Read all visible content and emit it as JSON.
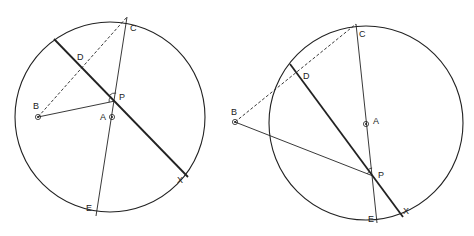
{
  "colors": {
    "stroke": "#222222",
    "background": "#ffffff"
  },
  "figures": [
    {
      "id": "left",
      "circle": {
        "cx": 110,
        "cy": 117,
        "r": 95
      },
      "points": {
        "C": {
          "x": 127,
          "y": 17,
          "label": "C",
          "lx": 130,
          "ly": 31
        },
        "D": {
          "x": 82,
          "y": 67,
          "label": "D",
          "lx": 77,
          "ly": 60
        },
        "B": {
          "x": 38,
          "y": 117,
          "label": "B",
          "lx": 33,
          "ly": 109
        },
        "P": {
          "x": 115,
          "y": 101,
          "label": "P",
          "lx": 119,
          "ly": 100
        },
        "A": {
          "x": 112,
          "y": 117,
          "label": "A",
          "lx": 100,
          "ly": 120
        },
        "E": {
          "x": 96,
          "y": 216,
          "label": "E",
          "lx": 86,
          "ly": 211
        },
        "X": {
          "x": 188,
          "y": 177,
          "label": "X",
          "lx": 177,
          "ly": 183
        },
        "chordStart": {
          "x": 54,
          "y": 39
        }
      }
    },
    {
      "id": "right",
      "circle": {
        "cx": 366,
        "cy": 123,
        "r": 97
      },
      "points": {
        "C": {
          "x": 356,
          "y": 24,
          "label": "C",
          "lx": 359,
          "ly": 37
        },
        "D": {
          "x": 296,
          "y": 72,
          "label": "D",
          "lx": 303,
          "ly": 79
        },
        "B": {
          "x": 235,
          "y": 122,
          "label": "B",
          "lx": 231,
          "ly": 115
        },
        "P": {
          "x": 373,
          "y": 176,
          "label": "P",
          "lx": 378,
          "ly": 178
        },
        "A": {
          "x": 366,
          "y": 124,
          "label": "A",
          "lx": 373,
          "ly": 124
        },
        "E": {
          "x": 377,
          "y": 223,
          "label": "E",
          "lx": 368,
          "ly": 222
        },
        "X": {
          "x": 403,
          "y": 217,
          "label": "X",
          "lx": 403,
          "ly": 214
        },
        "chordStart": {
          "x": 290,
          "y": 64
        }
      }
    }
  ]
}
